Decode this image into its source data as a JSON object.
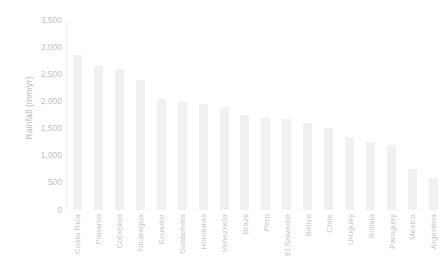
{
  "chart_data": {
    "type": "bar",
    "title": "",
    "subtitle": "",
    "xlabel": "",
    "ylabel": "Rainfall (mm/yr)",
    "ylim": [
      0,
      3500
    ],
    "grid": false,
    "legend": false,
    "legend_position": "none",
    "bar_color": "#f1f1f1",
    "text_color": "#c2c2c2",
    "axis_color": "#f0f0f0",
    "ytick_labels": [
      "3,500",
      "3,000",
      "2,500",
      "2,000",
      "1,500",
      "1,000",
      "500",
      "0"
    ],
    "ytick_values": [
      3500,
      3000,
      2500,
      2000,
      1500,
      1000,
      500,
      0
    ],
    "categories": [
      "Costa Rica",
      "Panama",
      "Colombia",
      "Nicaragua",
      "Ecuador",
      "Guatemala",
      "Honduras",
      "Venezuela",
      "Brazil",
      "Peru",
      "El Salvador",
      "Belize",
      "Chile",
      "Uruguay",
      "Bolivia",
      "Paraguay",
      "Mexico",
      "Argentina"
    ],
    "values": [
      2850,
      2650,
      2600,
      2400,
      2050,
      1990,
      1950,
      1900,
      1750,
      1700,
      1680,
      1600,
      1520,
      1350,
      1250,
      1200,
      750,
      590
    ]
  }
}
